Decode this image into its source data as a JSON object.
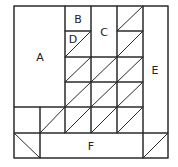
{
  "diagram": {
    "type": "quilt-block-layout",
    "colors": {
      "line": "#2a2a2a",
      "background": "#ffffff",
      "text": "#222222"
    },
    "labels": {
      "A": "A",
      "B": "B",
      "C": "C",
      "D": "D",
      "E": "E",
      "F": "F"
    },
    "regions": [
      {
        "id": "A",
        "x": 14,
        "y": 6,
        "w": 51,
        "h": 101
      },
      {
        "id": "B",
        "x": 65,
        "y": 6,
        "w": 26,
        "h": 25
      },
      {
        "id": "D",
        "x": 65,
        "y": 31,
        "w": 26,
        "h": 26,
        "diagonal": "bl-tr"
      },
      {
        "id": "C",
        "x": 91,
        "y": 6,
        "w": 26,
        "h": 51
      },
      {
        "id": "E",
        "x": 143,
        "y": 6,
        "w": 25,
        "h": 127
      },
      {
        "id": "F",
        "x": 40,
        "y": 133,
        "w": 103,
        "h": 25
      }
    ],
    "half_square_triangle_cells": 15
  }
}
